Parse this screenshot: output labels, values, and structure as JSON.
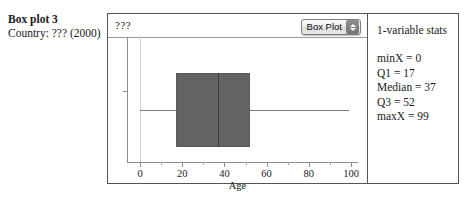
{
  "caption": {
    "title": "Box plot 3",
    "subtitle": "Country: ??? (2000)"
  },
  "plot": {
    "variable_label": "???",
    "plot_type_menu": {
      "label": "Box Plot",
      "stepper_up": "up-arrow",
      "stepper_down": "down-arrow"
    },
    "x_axis": {
      "title": "Age",
      "ticks": [
        0,
        20,
        40,
        60,
        80,
        100
      ],
      "minor_ticks": [
        10,
        30,
        50,
        70,
        90
      ],
      "range": [
        -6,
        105
      ]
    },
    "colors": {
      "box_fill": "#636363",
      "box_stroke": "#5a5a5a",
      "median": "#3d3d3d",
      "whisker": "#7a7a7a",
      "axis": "#8e8e8e",
      "frame": "#555555"
    }
  },
  "stats": {
    "title": "1-variable stats",
    "rows": [
      "minX = 0",
      "Q1 = 17",
      "Median = 37",
      "Q3 = 52",
      "maxX = 99"
    ]
  },
  "chart_data": {
    "type": "box",
    "title": "Box plot 3",
    "subtitle": "Country: ??? (2000)",
    "xlabel": "Age",
    "ylabel": "",
    "xlim": [
      -6,
      105
    ],
    "xticks": [
      0,
      20,
      40,
      60,
      80,
      100
    ],
    "xminorticks": [
      10,
      30,
      50,
      70,
      90
    ],
    "grid": false,
    "legend": null,
    "series": [
      {
        "name": "???",
        "min": 0,
        "q1": 17,
        "median": 37,
        "q3": 52,
        "max": 99,
        "outliers": []
      }
    ],
    "annotations": [
      "minX = 0",
      "Q1 = 17",
      "Median = 37",
      "Q3 = 52",
      "maxX = 99"
    ]
  }
}
